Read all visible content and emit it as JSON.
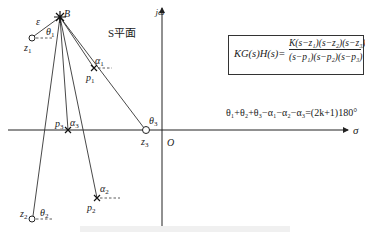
{
  "diagram": {
    "title_region": "S平面",
    "axes": {
      "real_axis_label": "σ",
      "imag_axis_label": "jω",
      "origin_label": "O"
    },
    "test_point": {
      "label": "B",
      "offset_label": "ε"
    },
    "zeros": [
      {
        "name": "z1",
        "label": "z",
        "sub": "1",
        "angle_label": "θ",
        "angle_sub": "1"
      },
      {
        "name": "z2",
        "label": "z",
        "sub": "2",
        "angle_label": "θ",
        "angle_sub": "2"
      },
      {
        "name": "z3",
        "label": "z",
        "sub": "3",
        "angle_label": "θ",
        "angle_sub": "3"
      }
    ],
    "poles": [
      {
        "name": "p1",
        "label": "p",
        "sub": "1",
        "angle_label": "α",
        "angle_sub": "1"
      },
      {
        "name": "p2",
        "label": "p",
        "sub": "2",
        "angle_label": "α",
        "angle_sub": "2"
      },
      {
        "name": "p3",
        "label": "p",
        "sub": "3",
        "angle_label": "α",
        "angle_sub": "3"
      }
    ],
    "transfer_function": {
      "lhs": "KG(s)H(s)=",
      "numerator": "K(s−z₁)(s−z₂)(s−z₃)",
      "denominator": "(s−p₁)(s−p₂)(s−p₃)"
    },
    "angle_condition": "θ₁+θ₂+θ₃−α₁−α₂−α₃=(2k+1)180°"
  }
}
